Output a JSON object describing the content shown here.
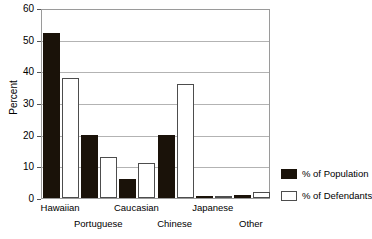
{
  "chart_data": {
    "type": "bar",
    "title": "",
    "xlabel": "",
    "ylabel": "Percent",
    "ylim": [
      0,
      60
    ],
    "yticks": [
      "0",
      "10",
      "20",
      "30",
      "40",
      "50",
      "60"
    ],
    "grid": true,
    "legend_position": "right",
    "categories": [
      "Hawaiian",
      "Portuguese",
      "Caucasian",
      "Chinese",
      "Japanese",
      "Other"
    ],
    "series": [
      {
        "name": "% of Population",
        "color": "#1a1209",
        "values": [
          52,
          20,
          6,
          20,
          0.5,
          1
        ]
      },
      {
        "name": "% of Defendants",
        "color": "#ffffff",
        "values": [
          38,
          13,
          11,
          36,
          0.5,
          2
        ]
      }
    ]
  },
  "legend": {
    "items": [
      {
        "label": "% of Population"
      },
      {
        "label": "% of Defendants"
      }
    ]
  }
}
